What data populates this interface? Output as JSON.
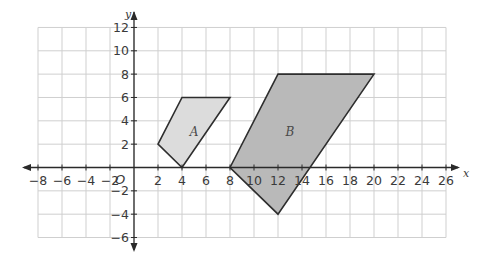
{
  "chart_data": {
    "type": "coordinate-grid",
    "title": "",
    "xlabel": "x",
    "ylabel": "y",
    "origin_label": "O",
    "xlim": [
      -8,
      26
    ],
    "ylim": [
      -6,
      12
    ],
    "grid": true,
    "grid_step": 2,
    "x_ticks": [
      -8,
      -6,
      -4,
      -2,
      2,
      4,
      6,
      8,
      10,
      12,
      14,
      16,
      18,
      20,
      22,
      24,
      26
    ],
    "y_ticks": [
      -6,
      -4,
      -2,
      2,
      4,
      6,
      8,
      10,
      12
    ],
    "shapes": [
      {
        "name": "A",
        "label": "A",
        "vertices": [
          [
            2,
            2
          ],
          [
            4,
            6
          ],
          [
            8,
            6
          ],
          [
            4,
            0
          ]
        ],
        "fill": "#dcdcdc",
        "label_pos": [
          5,
          3
        ]
      },
      {
        "name": "B",
        "label": "B",
        "vertices": [
          [
            8,
            0
          ],
          [
            12,
            8
          ],
          [
            20,
            8
          ],
          [
            12,
            -4
          ]
        ],
        "fill": "#b9b9b9",
        "label_pos": [
          13,
          3
        ]
      }
    ]
  },
  "colors": {
    "grid": "#cfcfcf",
    "axis": "#2a2a2a",
    "outline": "#2e2e2e"
  }
}
